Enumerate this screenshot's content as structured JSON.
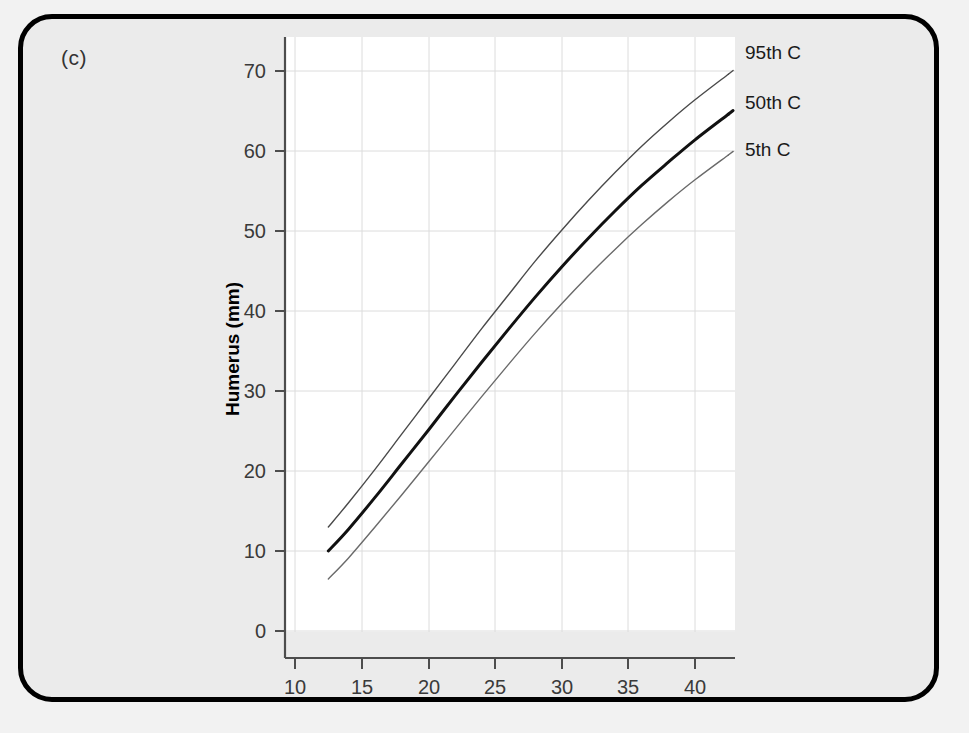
{
  "figure": {
    "panel_label": "(c)",
    "background_color": "#ebebeb",
    "plot_background_color": "#ffffff",
    "border_color": "#000000"
  },
  "chart_data": {
    "type": "line",
    "title": "",
    "subtitle": "",
    "xlabel": "Length of gestation (weeks)",
    "ylabel": "Humerus (mm)",
    "xlim": [
      8.5,
      44.5
    ],
    "ylim": [
      -3.5,
      74.5
    ],
    "xticks": [
      10,
      15,
      20,
      25,
      30,
      35,
      40
    ],
    "yticks": [
      0,
      10,
      20,
      30,
      40,
      50,
      60,
      70
    ],
    "xtick_labels": [
      "10",
      "15",
      "20",
      "25",
      "30",
      "35",
      "40"
    ],
    "ytick_labels": [
      "0",
      "10",
      "20",
      "30",
      "40",
      "50",
      "60",
      "70"
    ],
    "grid": true,
    "grid_color": "#d9d9d9",
    "legend_position": "right-inline",
    "x": [
      12.5,
      14,
      16,
      18,
      20,
      22,
      24,
      26,
      28,
      30,
      32,
      34,
      36,
      38,
      40,
      42.5
    ],
    "series": [
      {
        "name": "95th C",
        "label": "95th C",
        "color": "#4a4a4a",
        "line_width": 1.4,
        "values": [
          13.0,
          16.0,
          20.2,
          24.6,
          29.0,
          33.4,
          37.8,
          42.0,
          46.2,
          50.1,
          53.8,
          57.3,
          60.6,
          63.6,
          66.4,
          69.6
        ]
      },
      {
        "name": "50th C",
        "label": "50th C",
        "color": "#111111",
        "line_width": 3.0,
        "values": [
          10.0,
          12.7,
          16.7,
          20.9,
          25.1,
          29.4,
          33.6,
          37.7,
          41.7,
          45.5,
          49.1,
          52.5,
          55.7,
          58.6,
          61.4,
          64.6
        ]
      },
      {
        "name": "5th C",
        "label": "5th C",
        "color": "#6a6a6a",
        "line_width": 1.4,
        "values": [
          6.5,
          9.1,
          13.0,
          17.0,
          21.1,
          25.2,
          29.3,
          33.3,
          37.2,
          40.9,
          44.4,
          47.7,
          50.8,
          53.7,
          56.4,
          59.5
        ]
      }
    ],
    "legend_entries": [
      {
        "label": "95th C"
      },
      {
        "label": "50th C"
      },
      {
        "label": "5th C"
      }
    ]
  }
}
